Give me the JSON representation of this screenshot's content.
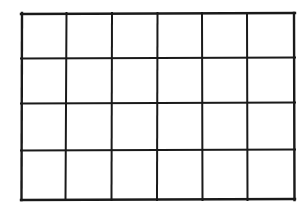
{
  "figure": {
    "background_color": "#ffffff",
    "line_color": "#1a1a1a",
    "cell_fill_color": "#ffffff",
    "outer_border_width": 2.4,
    "inner_line_width": 2.0
  },
  "chart_data": {
    "type": "table",
    "title": "",
    "rows": 4,
    "columns": 6,
    "total_cells": 24,
    "column_headers": [
      "",
      "",
      "",
      "",
      "",
      ""
    ],
    "cells": [
      [
        "",
        "",
        "",
        "",
        "",
        ""
      ],
      [
        "",
        "",
        "",
        "",
        "",
        ""
      ],
      [
        "",
        "",
        "",
        "",
        "",
        ""
      ],
      [
        "",
        "",
        "",
        "",
        "",
        ""
      ]
    ],
    "grid": true,
    "legend": "none",
    "geometry": {
      "left": 21,
      "top": 13,
      "right": 295,
      "bottom": 200,
      "width": 274,
      "height": 187,
      "vertical_line_x": [
        21,
        66,
        112,
        157,
        202,
        247,
        295
      ],
      "horizontal_line_y": [
        13,
        58,
        103,
        150,
        200
      ],
      "column_widths": [
        45,
        46,
        45,
        45,
        45,
        48
      ],
      "row_heights": [
        45,
        45,
        47,
        50
      ]
    }
  }
}
